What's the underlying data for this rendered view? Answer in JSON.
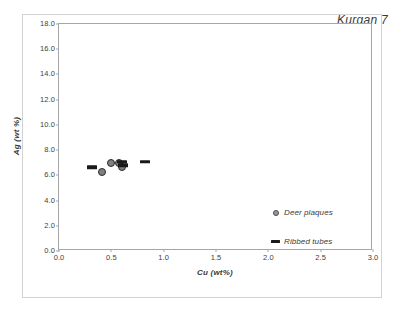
{
  "chart_data": {
    "type": "scatter",
    "title": "Kurgan 7",
    "xlabel": "Cu (wt%)",
    "ylabel": "Ag (wt %)",
    "xlim": [
      0.0,
      3.0
    ],
    "ylim": [
      0.0,
      18.0
    ],
    "xticks": [
      "0.0",
      "0.5",
      "1.0",
      "1.5",
      "2.0",
      "2.5",
      "3.0"
    ],
    "yticks": [
      "0.0",
      "2.0",
      "4.0",
      "6.0",
      "8.0",
      "10.0",
      "12.0",
      "14.0",
      "16.0",
      "18.0"
    ],
    "grid": false,
    "legend_position": "bottom-right-inside",
    "series": [
      {
        "name": "Deer plaques",
        "marker": "circle",
        "color": "#808080",
        "edge_color": "#2b2b2b",
        "points": [
          {
            "x": 0.41,
            "y": 6.3
          },
          {
            "x": 0.5,
            "y": 6.95
          },
          {
            "x": 0.57,
            "y": 6.95
          },
          {
            "x": 0.6,
            "y": 6.7
          }
        ]
      },
      {
        "name": "Ribbed tubes",
        "marker": "dash",
        "color": "#1a1a1a",
        "points": [
          {
            "x": 0.32,
            "y": 6.65
          },
          {
            "x": 0.6,
            "y": 7.05
          },
          {
            "x": 0.61,
            "y": 6.8
          },
          {
            "x": 0.82,
            "y": 7.05
          }
        ]
      }
    ],
    "legend": [
      {
        "label": "Deer plaques",
        "marker": "circle"
      },
      {
        "label": "Ribbed tubes",
        "marker": "dash"
      }
    ]
  },
  "colors": {
    "axis": "#a6a6a6",
    "frame": "#d2d2d2",
    "text": "#3a3a3a",
    "marker_dark": "#1a1a1a",
    "marker_gray": "#808080"
  }
}
